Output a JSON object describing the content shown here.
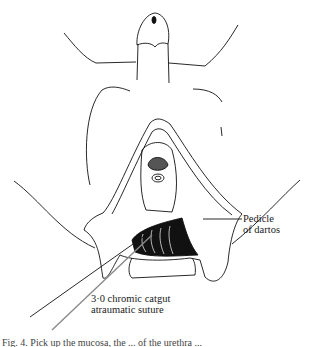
{
  "figure": {
    "type": "surgical-illustration",
    "labels": {
      "pedicle": [
        "Pedicle",
        "of dartos"
      ],
      "suture": [
        "3·0 chromic catgut",
        "atraumatic suture"
      ]
    },
    "caption": "Fig. 4. Pick up the mucosa, the ... of the urethra ..."
  },
  "colors": {
    "ink": "#111111",
    "background": "#ffffff",
    "suture_line": "#8a8a8a"
  }
}
